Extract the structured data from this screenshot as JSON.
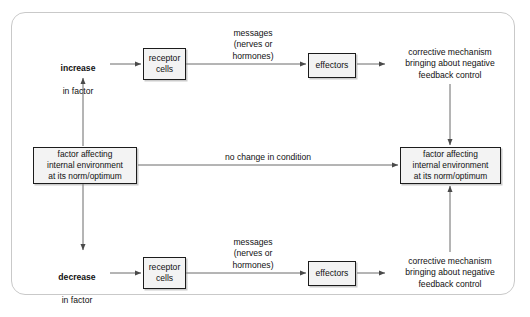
{
  "diagram": {
    "border_color": "#c9c9c9",
    "box_fill": "#f3f3f3",
    "box_border": "#1c1c1c",
    "line_color": "#5b5b5b",
    "text_color": "#111111"
  },
  "top_branch": {
    "stimulus_bold": "increase",
    "stimulus_rest": "in factor",
    "receptor": "receptor\ncells",
    "messages": "messages\n(nerves or\nhormones)",
    "effectors": "effectors",
    "corrective": "corrective mechanism\nbringing about negative\nfeedback control"
  },
  "middle_branch": {
    "source_box": "factor affecting\ninternal environment\nat its norm/optimum",
    "no_change": "no change in condition",
    "target_box": "factor affecting\ninternal environment\nat its norm/optimum"
  },
  "bottom_branch": {
    "stimulus_bold": "decrease",
    "stimulus_rest": "in factor",
    "receptor": "receptor\ncells",
    "messages": "messages\n(nerves or\nhormones)",
    "effectors": "effectors",
    "corrective": "corrective mechanism\nbringing about negative\nfeedback control"
  }
}
